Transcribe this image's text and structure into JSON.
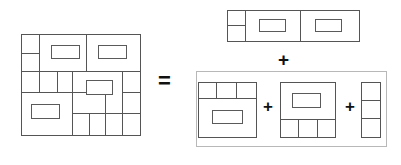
{
  "figure": {
    "stroke_color": "#555555",
    "inner_stroke_color": "#5a5a5a",
    "bracket_color": "#b8b8b8",
    "fill_color": "#ffffff",
    "stroke_width": 1.6,
    "inner_stroke_width": 1.6,
    "canvas": {
      "width": 401,
      "height": 165
    }
  },
  "operators": {
    "equals": "=",
    "plus_main": "+",
    "plus_a": "+",
    "plus_b": "+"
  },
  "shapes": {
    "whole": {
      "name": "whole-floorplan",
      "x": 21,
      "y": 34,
      "w": 119,
      "h": 101,
      "lines": [
        {
          "x1": 21,
          "y1": 71,
          "x2": 140,
          "y2": 71
        },
        {
          "x1": 21,
          "y1": 92,
          "x2": 105,
          "y2": 92
        },
        {
          "x1": 39,
          "y1": 34,
          "x2": 39,
          "y2": 92
        },
        {
          "x1": 21,
          "y1": 53,
          "x2": 39,
          "y2": 53
        },
        {
          "x1": 86,
          "y1": 34,
          "x2": 86,
          "y2": 71
        },
        {
          "x1": 57,
          "y1": 71,
          "x2": 57,
          "y2": 92
        },
        {
          "x1": 72,
          "y1": 71,
          "x2": 72,
          "y2": 92
        },
        {
          "x1": 72,
          "y1": 71,
          "x2": 72,
          "y2": 135
        },
        {
          "x1": 122,
          "y1": 71,
          "x2": 122,
          "y2": 135
        },
        {
          "x1": 122,
          "y1": 92,
          "x2": 140,
          "y2": 92
        },
        {
          "x1": 122,
          "y1": 113,
          "x2": 140,
          "y2": 113
        },
        {
          "x1": 72,
          "y1": 113,
          "x2": 122,
          "y2": 113
        },
        {
          "x1": 89,
          "y1": 113,
          "x2": 89,
          "y2": 135
        },
        {
          "x1": 105,
          "y1": 113,
          "x2": 105,
          "y2": 135
        },
        {
          "x1": 105,
          "y1": 92,
          "x2": 105,
          "y2": 113
        }
      ],
      "rooms": [
        {
          "x": 51,
          "y": 45,
          "w": 28,
          "h": 13
        },
        {
          "x": 98,
          "y": 45,
          "w": 28,
          "h": 13
        },
        {
          "x": 86,
          "y": 80,
          "w": 26,
          "h": 14
        },
        {
          "x": 31,
          "y": 104,
          "w": 28,
          "h": 14
        }
      ]
    },
    "piece_top": {
      "name": "piece-top-strip",
      "x": 227,
      "y": 10,
      "w": 132,
      "h": 31,
      "lines": [
        {
          "x1": 245,
          "y1": 10,
          "x2": 245,
          "y2": 41
        },
        {
          "x1": 227,
          "y1": 25,
          "x2": 245,
          "y2": 25
        },
        {
          "x1": 300,
          "y1": 10,
          "x2": 300,
          "y2": 41
        }
      ],
      "rooms": [
        {
          "x": 259,
          "y": 19,
          "w": 26,
          "h": 12
        },
        {
          "x": 315,
          "y": 19,
          "w": 26,
          "h": 12
        }
      ]
    },
    "piece_a": {
      "name": "piece-lower-left",
      "x": 198,
      "y": 82,
      "w": 58,
      "h": 55,
      "lines": [
        {
          "x1": 198,
          "y1": 98,
          "x2": 256,
          "y2": 98
        },
        {
          "x1": 216,
          "y1": 82,
          "x2": 216,
          "y2": 98
        },
        {
          "x1": 236,
          "y1": 82,
          "x2": 236,
          "y2": 98
        }
      ],
      "rooms": [
        {
          "x": 212,
          "y": 110,
          "w": 30,
          "h": 13
        }
      ]
    },
    "piece_b": {
      "name": "piece-lower-middle",
      "x": 280,
      "y": 82,
      "w": 55,
      "h": 55,
      "lines": [
        {
          "x1": 280,
          "y1": 119,
          "x2": 335,
          "y2": 119
        },
        {
          "x1": 298,
          "y1": 119,
          "x2": 298,
          "y2": 137
        },
        {
          "x1": 317,
          "y1": 119,
          "x2": 317,
          "y2": 137
        }
      ],
      "rooms": [
        {
          "x": 292,
          "y": 93,
          "w": 28,
          "h": 14
        }
      ]
    },
    "piece_c": {
      "name": "piece-lower-right-column",
      "x": 361,
      "y": 82,
      "w": 19,
      "h": 55,
      "lines": [
        {
          "x1": 361,
          "y1": 100,
          "x2": 380,
          "y2": 100
        },
        {
          "x1": 361,
          "y1": 118,
          "x2": 380,
          "y2": 118
        }
      ],
      "rooms": []
    },
    "bracket": {
      "name": "group-bracket",
      "x": 196,
      "y": 71,
      "w": 190,
      "h": 75
    }
  }
}
